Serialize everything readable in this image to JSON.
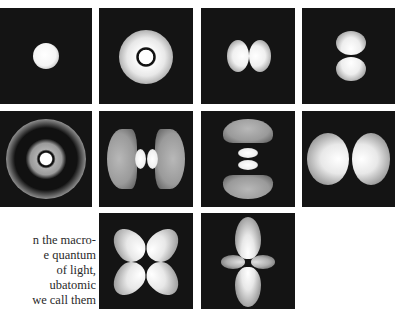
{
  "figure": {
    "panels": [
      {
        "id": "1s",
        "row": 1,
        "col": 1,
        "shape": "single bright sphere"
      },
      {
        "id": "2s",
        "row": 1,
        "col": 2,
        "shape": "bright core with dark node ring, surrounded by glowing halo"
      },
      {
        "id": "2p-x",
        "row": 1,
        "col": 3,
        "shape": "two lobes horizontal"
      },
      {
        "id": "2p-z",
        "row": 1,
        "col": 4,
        "shape": "two lobes vertical"
      },
      {
        "id": "3s",
        "row": 2,
        "col": 1,
        "shape": "concentric rings with small bright core"
      },
      {
        "id": "3p-x",
        "row": 2,
        "col": 2,
        "shape": "two inner lobes with two outer crescents, horizontal"
      },
      {
        "id": "3p-z",
        "row": 2,
        "col": 3,
        "shape": "two inner lobes with two outer crescents, vertical"
      },
      {
        "id": "3p-large",
        "row": 2,
        "col": 4,
        "shape": "two large lobes horizontal"
      },
      {
        "id": "3d-xy",
        "row": 3,
        "col": 2,
        "shape": "four-leaf clover lobes diagonal"
      },
      {
        "id": "3d-z2",
        "row": 3,
        "col": 3,
        "shape": "two large vertical lobes with small horizontal lobes"
      }
    ]
  },
  "text": {
    "lines": [
      "n the macro-",
      "e quantum",
      "of light,",
      "ubatomic",
      "we call them"
    ]
  }
}
